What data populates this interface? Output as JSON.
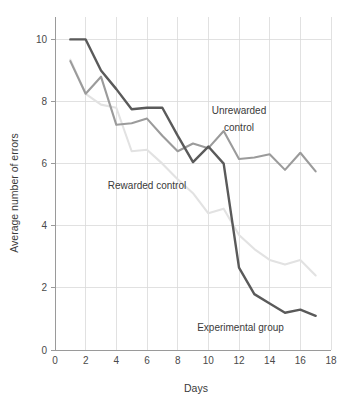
{
  "chart_data": {
    "type": "line",
    "title": "",
    "xlabel": "Days",
    "ylabel": "Average number of errors",
    "xlim": [
      0,
      18
    ],
    "ylim": [
      0,
      10.4
    ],
    "xticks": [
      0,
      2,
      4,
      6,
      8,
      10,
      12,
      14,
      16,
      18
    ],
    "yticks": [
      0,
      2,
      4,
      6,
      8,
      10
    ],
    "xtick_labels": [
      "0",
      "2",
      "4",
      "6",
      "8",
      "10",
      "12",
      "14",
      "16",
      "18"
    ],
    "ytick_labels": [
      "0",
      "2",
      "4",
      "6",
      "8",
      "10"
    ],
    "grid": true,
    "grid_color": "#d9d9d9",
    "legend_position": "inline-annotations",
    "x": [
      1,
      2,
      3,
      4,
      5,
      6,
      7,
      8,
      9,
      10,
      11,
      12,
      13,
      14,
      15,
      16,
      17
    ],
    "series": [
      {
        "name": "Rewarded control",
        "color": "#e2e2e2",
        "label_x": 6.0,
        "label_y": 5.2,
        "values": [
          9.35,
          8.25,
          7.9,
          7.8,
          6.4,
          6.45,
          6.0,
          5.5,
          5.05,
          4.4,
          4.55,
          3.7,
          3.25,
          2.9,
          2.75,
          2.9,
          2.4
        ]
      },
      {
        "name": "Unrewarded control",
        "color": "#9b9b9b",
        "label_x": 12.0,
        "label_y": 7.35,
        "values": [
          9.3,
          8.25,
          8.8,
          7.25,
          7.3,
          7.45,
          6.9,
          6.4,
          6.65,
          6.5,
          7.05,
          6.15,
          6.2,
          6.3,
          5.8,
          6.35,
          5.75
        ]
      },
      {
        "name": "Experimental group",
        "color": "#5a5a5a",
        "label_x": 12.1,
        "label_y": 0.62,
        "values": [
          10.0,
          10.0,
          9.0,
          8.4,
          7.75,
          7.8,
          7.8,
          6.9,
          6.05,
          6.55,
          6.0,
          2.65,
          1.8,
          1.5,
          1.2,
          1.3,
          1.1
        ]
      }
    ],
    "annotations": [
      {
        "text": "Unrewarded",
        "x": 12.0,
        "y": 7.6
      },
      {
        "text": "control",
        "x": 12.0,
        "y": 7.05
      },
      {
        "text": "Rewarded control",
        "x": 6.0,
        "y": 5.2
      },
      {
        "text": "Experimental group",
        "x": 12.1,
        "y": 0.62
      }
    ]
  },
  "axis": {
    "x_title": "Days",
    "y_title": "Average number of errors",
    "axis_color": "#9a9a9a"
  },
  "labels": {
    "unrewarded_line1": "Unrewarded",
    "unrewarded_line2": "control",
    "rewarded": "Rewarded control",
    "experimental": "Experimental group"
  }
}
